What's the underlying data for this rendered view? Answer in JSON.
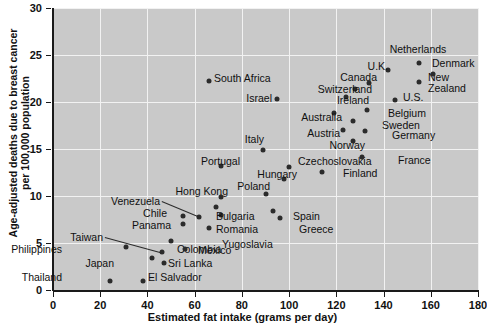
{
  "chart_data": {
    "type": "scatter",
    "title": "",
    "xlabel": "Estimated fat intake (grams per day)",
    "ylabel": "Age-adjusted deaths due to breast cancer per 100,000 population",
    "ylabel_line1": "Age-adjusted deaths due to breast cancer",
    "ylabel_line2": "per 100,000 population",
    "xlim": [
      0,
      180
    ],
    "ylim": [
      0,
      30
    ],
    "xticks": [
      0,
      20,
      40,
      60,
      80,
      100,
      120,
      140,
      160,
      180
    ],
    "yticks": [
      0,
      5,
      10,
      15,
      20,
      25,
      30
    ],
    "xtick_labels": [
      "0",
      "20",
      "40",
      "60",
      "80",
      "100",
      "120",
      "140",
      "160",
      "180"
    ],
    "ytick_labels": [
      "0",
      "5",
      "10",
      "15",
      "20",
      "25",
      "30"
    ],
    "grid": true,
    "legend": "none",
    "plot_background": "#c9c9c9",
    "gridline_color": "#f2f2f2",
    "marker_color": "#2b2b2b",
    "points": [
      {
        "label": "Thailand",
        "x": 24,
        "y": 1.0,
        "lx": 62,
        "ly": 272,
        "align": "right"
      },
      {
        "label": "El Salvador",
        "x": 38,
        "y": 1.0,
        "lx": 148,
        "ly": 272,
        "align": "left"
      },
      {
        "label": "Philippines",
        "x": 31,
        "y": 4.6,
        "lx": 62,
        "ly": 244,
        "align": "right"
      },
      {
        "label": "Japan",
        "x": 42,
        "y": 3.4,
        "lx": 114,
        "ly": 258,
        "align": "right"
      },
      {
        "label": "Taiwan",
        "x": 46,
        "y": 4.0,
        "lx": 103,
        "ly": 232,
        "align": "right",
        "leader": true
      },
      {
        "label": "Sri Lanka",
        "x": 47,
        "y": 2.9,
        "lx": 168,
        "ly": 258,
        "align": "left"
      },
      {
        "label": "Colombia",
        "x": 50,
        "y": 5.2,
        "lx": 177,
        "ly": 244,
        "align": "left"
      },
      {
        "label": "Mexico",
        "x": 56,
        "y": 4.4,
        "lx": 198,
        "ly": 245,
        "align": "left"
      },
      {
        "label": "Panama",
        "x": 55,
        "y": 7.0,
        "lx": 171,
        "ly": 220,
        "align": "right"
      },
      {
        "label": "Chile",
        "x": 55,
        "y": 7.9,
        "lx": 167,
        "ly": 208,
        "align": "right"
      },
      {
        "label": "Venezuela",
        "x": 62,
        "y": 7.8,
        "lx": 160,
        "ly": 196,
        "align": "right",
        "leader": true
      },
      {
        "label": "Yugoslavia",
        "x": 66,
        "y": 6.6,
        "lx": 222,
        "ly": 239,
        "align": "left"
      },
      {
        "label": "Romania",
        "x": 71,
        "y": 8.0,
        "lx": 216,
        "ly": 224,
        "align": "left"
      },
      {
        "label": "Bulgaria",
        "x": 69,
        "y": 8.8,
        "lx": 216,
        "ly": 211,
        "align": "left"
      },
      {
        "label": "Greece",
        "x": 96,
        "y": 7.7,
        "lx": 299,
        "ly": 224,
        "align": "left"
      },
      {
        "label": "Spain",
        "x": 93,
        "y": 8.4,
        "lx": 293,
        "ly": 211,
        "align": "left"
      },
      {
        "label": "Hong Kong",
        "x": 71,
        "y": 9.9,
        "lx": 228,
        "ly": 186,
        "align": "right"
      },
      {
        "label": "Poland",
        "x": 90,
        "y": 10.2,
        "lx": 270,
        "ly": 181,
        "align": "right"
      },
      {
        "label": "Hungary",
        "x": 98,
        "y": 11.8,
        "lx": 297,
        "ly": 169,
        "align": "right"
      },
      {
        "label": "Portugal",
        "x": 71,
        "y": 13.2,
        "lx": 240,
        "ly": 156,
        "align": "right"
      },
      {
        "label": "Czechoslovakia",
        "x": 100,
        "y": 13.1,
        "lx": 298,
        "ly": 156,
        "align": "left"
      },
      {
        "label": "Finland",
        "x": 114,
        "y": 12.6,
        "lx": 343,
        "ly": 168,
        "align": "left"
      },
      {
        "label": "Italy",
        "x": 89,
        "y": 14.9,
        "lx": 264,
        "ly": 134,
        "align": "right"
      },
      {
        "label": "France",
        "x": 131,
        "y": 14.1,
        "lx": 398,
        "ly": 155,
        "align": "left"
      },
      {
        "label": "Norway",
        "x": 127,
        "y": 15.9,
        "lx": 365,
        "ly": 140,
        "align": "right"
      },
      {
        "label": "Germany",
        "x": 132,
        "y": 16.9,
        "lx": 392,
        "ly": 130,
        "align": "left"
      },
      {
        "label": "Austria",
        "x": 123,
        "y": 17.0,
        "lx": 340,
        "ly": 128,
        "align": "right"
      },
      {
        "label": "Sweden",
        "x": 127,
        "y": 18.0,
        "lx": 382,
        "ly": 120,
        "align": "left"
      },
      {
        "label": "Australia",
        "x": 119,
        "y": 18.8,
        "lx": 342,
        "ly": 112,
        "align": "right"
      },
      {
        "label": "Belgium",
        "x": 133,
        "y": 19.2,
        "lx": 388,
        "ly": 108,
        "align": "left"
      },
      {
        "label": "Israel",
        "x": 95,
        "y": 20.3,
        "lx": 272,
        "ly": 93,
        "align": "right"
      },
      {
        "label": "Ireland",
        "x": 124,
        "y": 20.5,
        "lx": 369,
        "ly": 95,
        "align": "right"
      },
      {
        "label": "U.S.",
        "x": 145,
        "y": 20.2,
        "lx": 403,
        "ly": 92,
        "align": "left"
      },
      {
        "label": "Switzerland",
        "x": 128,
        "y": 21.4,
        "lx": 372,
        "ly": 84,
        "align": "right"
      },
      {
        "label": "South Africa",
        "x": 66,
        "y": 22.2,
        "lx": 214,
        "ly": 73,
        "align": "left"
      },
      {
        "label": "New Zealand",
        "x": 155,
        "y": 22.1,
        "lx": 428,
        "ly": 72,
        "align": "left",
        "two_line": true
      },
      {
        "label": "Canada",
        "x": 134,
        "y": 22.0,
        "lx": 377,
        "ly": 72,
        "align": "right"
      },
      {
        "label": "Denmark",
        "x": 161,
        "y": 23.0,
        "lx": 432,
        "ly": 58,
        "align": "left"
      },
      {
        "label": "U.K.",
        "x": 142,
        "y": 23.4,
        "lx": 388,
        "ly": 61,
        "align": "right"
      },
      {
        "label": "Netherlands",
        "x": 155,
        "y": 24.2,
        "lx": 418,
        "ly": 44,
        "align": "center"
      }
    ]
  }
}
